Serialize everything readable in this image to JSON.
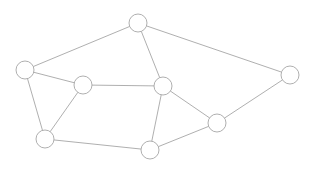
{
  "canvas": {
    "width": 313,
    "height": 174,
    "background": "#ffffff"
  },
  "style": {
    "node_stroke": "#9a9a9a",
    "node_fill": "#ffffff",
    "node_stroke_width": 0.8,
    "node_radius": 9,
    "edge_stroke": "#9a9a9a",
    "edge_stroke_width": 0.8
  },
  "chart_data": {
    "type": "diagram",
    "title": "",
    "subtitle": "",
    "xlabel": "",
    "ylabel": "",
    "grid": false,
    "legend": false,
    "node_count": 9,
    "edge_count": 13,
    "nodes": [
      {
        "id": "n1",
        "label": "",
        "x": 138,
        "y": 23,
        "r": 9,
        "degree": 3
      },
      {
        "id": "n2",
        "label": "",
        "x": 25,
        "y": 70,
        "r": 9,
        "degree": 3
      },
      {
        "id": "n3",
        "label": "",
        "x": 290,
        "y": 75,
        "r": 9,
        "degree": 2
      },
      {
        "id": "n4",
        "label": "",
        "x": 83,
        "y": 85,
        "r": 9,
        "degree": 3
      },
      {
        "id": "n5",
        "label": "",
        "x": 163,
        "y": 86,
        "r": 9,
        "degree": 4
      },
      {
        "id": "n6",
        "label": "",
        "x": 217,
        "y": 123,
        "r": 9,
        "degree": 3
      },
      {
        "id": "n7",
        "label": "",
        "x": 45,
        "y": 139,
        "r": 9,
        "degree": 3
      },
      {
        "id": "n8",
        "label": "",
        "x": 150,
        "y": 150,
        "r": 9,
        "degree": 3
      }
    ],
    "edges": [
      {
        "source": "n1",
        "target": "n2"
      },
      {
        "source": "n1",
        "target": "n3"
      },
      {
        "source": "n1",
        "target": "n5"
      },
      {
        "source": "n2",
        "target": "n4"
      },
      {
        "source": "n2",
        "target": "n7"
      },
      {
        "source": "n3",
        "target": "n6"
      },
      {
        "source": "n4",
        "target": "n5"
      },
      {
        "source": "n4",
        "target": "n7"
      },
      {
        "source": "n5",
        "target": "n6"
      },
      {
        "source": "n5",
        "target": "n8"
      },
      {
        "source": "n6",
        "target": "n8"
      },
      {
        "source": "n7",
        "target": "n8"
      }
    ]
  }
}
